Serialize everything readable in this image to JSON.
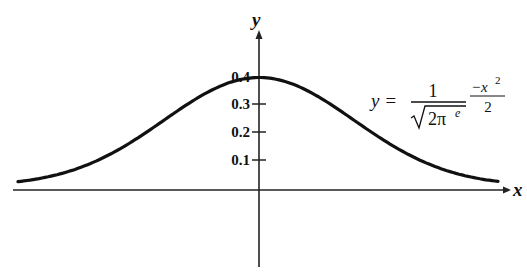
{
  "chart_data": {
    "type": "line",
    "title": "",
    "xlabel": "x",
    "ylabel": "y",
    "yticks": [
      "0.1",
      "0.2",
      "0.3",
      "0.4"
    ],
    "ylim": [
      0,
      0.45
    ],
    "grid": false,
    "legend": null,
    "annotation": {
      "lhs": "y =",
      "numerator": "1",
      "denominator": "√2π",
      "denominator_exponent": "e",
      "exp_numerator": "−x²",
      "exp_denominator": "2"
    },
    "series": [
      {
        "name": "standard normal curve",
        "x": [
          -2.5,
          -2,
          -1.5,
          -1,
          -0.5,
          0,
          0.5,
          1,
          1.5,
          2,
          2.5
        ],
        "y": [
          0.018,
          0.054,
          0.13,
          0.242,
          0.352,
          0.399,
          0.352,
          0.242,
          0.13,
          0.054,
          0.018
        ]
      }
    ]
  },
  "labels": {
    "x_axis": "x",
    "y_axis": "y",
    "ticks": [
      "0.4",
      "0.3",
      "0.2",
      "0.1"
    ],
    "formula_lhs": "y =",
    "formula_num": "1",
    "formula_sqrt_arg": "2π",
    "formula_e": "e",
    "formula_exp_num": "−x",
    "formula_exp_sq": "2",
    "formula_exp_den": "2"
  }
}
